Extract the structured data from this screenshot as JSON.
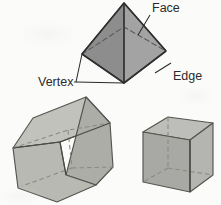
{
  "figure": {
    "background_color": "#fbfbfa",
    "labels": {
      "face": "Face",
      "vertex": "Vertex",
      "edge": "Edge"
    },
    "colors": {
      "outline": "#3a3a3a",
      "hidden_edge": "#6e6e6e",
      "leader_line": "#2b2b2b",
      "text": "#2b2b2b",
      "pyramid_left_face": "#8d8d8d",
      "pyramid_right_face": "#a3a3a3",
      "prism_front_face": "#b9b9b4",
      "prism_top_face": "#c2c2bd",
      "prism_side_face": "#adada8",
      "cube_left_face": "#a8a8a4",
      "cube_right_face": "#b4b4b0",
      "cube_top_face": "#bdbdb9"
    },
    "shapes": [
      {
        "name": "square-pyramid",
        "type": "pyramid",
        "faces": 5,
        "vertices": 5,
        "edges": 8,
        "apex": [
          124,
          3
        ],
        "base_front": [
          124,
          83
        ],
        "base_left": [
          82,
          54
        ],
        "base_right": [
          166,
          51
        ],
        "base_back": [
          124,
          27
        ]
      },
      {
        "name": "pentagonal-prism",
        "type": "prism",
        "faces": 7,
        "vertices": 10,
        "edges": 15
      },
      {
        "name": "cube",
        "type": "cube",
        "faces": 6,
        "vertices": 8,
        "edges": 12
      }
    ],
    "leaders": {
      "face": {
        "from": [
          151,
          16
        ],
        "to": [
          139,
          34
        ]
      },
      "edge": {
        "from": [
          172,
          62
        ],
        "to": [
          156,
          74
        ]
      },
      "vertex": {
        "bracket": true,
        "from": [
          76,
          82
        ],
        "to_left": [
          82,
          54
        ],
        "to_front": [
          124,
          83
        ]
      }
    }
  }
}
